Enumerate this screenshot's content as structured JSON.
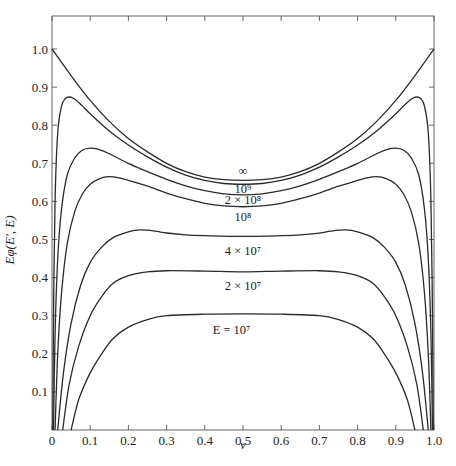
{
  "chart_data": {
    "type": "line",
    "title": "",
    "xlabel": "v",
    "ylabel": "Eφ(E′, E)",
    "xlim": [
      0,
      1.0
    ],
    "ylim": [
      0,
      1.1
    ],
    "grid": false,
    "x_ticks": [
      "0",
      "0.1",
      "0.2",
      "0.3",
      "0.4",
      "0.5",
      "0.6",
      "0.7",
      "0.8",
      "0.9",
      "1.0"
    ],
    "x_tick_values": [
      0,
      0.1,
      0.2,
      0.3,
      0.4,
      0.5,
      0.6,
      0.7,
      0.8,
      0.9,
      1.0
    ],
    "y_ticks": [
      "0.1",
      "0.2",
      "0.3",
      "0.4",
      "0.5",
      "0.6",
      "0.7",
      "0.8",
      "0.9",
      "1.0"
    ],
    "y_tick_values": [
      0.1,
      0.2,
      0.3,
      0.4,
      0.5,
      0.6,
      0.7,
      0.8,
      0.9,
      1.0
    ],
    "series": [
      {
        "name": "∞",
        "label": "∞",
        "label_at": [
          0.5,
          0.668
        ],
        "points": [
          [
            0,
            1.0
          ],
          [
            0.05,
            0.93
          ],
          [
            0.1,
            0.865
          ],
          [
            0.15,
            0.81
          ],
          [
            0.2,
            0.765
          ],
          [
            0.25,
            0.73
          ],
          [
            0.3,
            0.7
          ],
          [
            0.35,
            0.678
          ],
          [
            0.4,
            0.664
          ],
          [
            0.45,
            0.657
          ],
          [
            0.5,
            0.655
          ],
          [
            0.55,
            0.657
          ],
          [
            0.6,
            0.664
          ],
          [
            0.65,
            0.678
          ],
          [
            0.7,
            0.7
          ],
          [
            0.75,
            0.73
          ],
          [
            0.8,
            0.765
          ],
          [
            0.85,
            0.81
          ],
          [
            0.9,
            0.865
          ],
          [
            0.95,
            0.93
          ],
          [
            1.0,
            1.0
          ]
        ]
      },
      {
        "name": "10^9",
        "label": "10⁹",
        "label_at": [
          0.5,
          0.623
        ],
        "points": [
          [
            0.002,
            0.0
          ],
          [
            0.004,
            0.3
          ],
          [
            0.008,
            0.6
          ],
          [
            0.015,
            0.78
          ],
          [
            0.025,
            0.85
          ],
          [
            0.035,
            0.87
          ],
          [
            0.047,
            0.874
          ],
          [
            0.06,
            0.868
          ],
          [
            0.08,
            0.85
          ],
          [
            0.1,
            0.83
          ],
          [
            0.15,
            0.785
          ],
          [
            0.2,
            0.748
          ],
          [
            0.25,
            0.717
          ],
          [
            0.3,
            0.69
          ],
          [
            0.35,
            0.669
          ],
          [
            0.4,
            0.655
          ],
          [
            0.45,
            0.647
          ],
          [
            0.5,
            0.645
          ],
          [
            0.55,
            0.647
          ],
          [
            0.6,
            0.655
          ],
          [
            0.65,
            0.669
          ],
          [
            0.7,
            0.69
          ],
          [
            0.75,
            0.717
          ],
          [
            0.8,
            0.748
          ],
          [
            0.85,
            0.785
          ],
          [
            0.9,
            0.83
          ],
          [
            0.92,
            0.85
          ],
          [
            0.94,
            0.868
          ],
          [
            0.953,
            0.874
          ],
          [
            0.965,
            0.87
          ],
          [
            0.975,
            0.85
          ],
          [
            0.985,
            0.78
          ],
          [
            0.992,
            0.6
          ],
          [
            0.996,
            0.3
          ],
          [
            0.998,
            0.0
          ]
        ]
      },
      {
        "name": "2x10^8",
        "label": "2 × 10⁸",
        "label_at": [
          0.5,
          0.594
        ],
        "points": [
          [
            0.004,
            0.0
          ],
          [
            0.008,
            0.25
          ],
          [
            0.015,
            0.45
          ],
          [
            0.025,
            0.58
          ],
          [
            0.04,
            0.67
          ],
          [
            0.06,
            0.715
          ],
          [
            0.08,
            0.735
          ],
          [
            0.1,
            0.74
          ],
          [
            0.12,
            0.737
          ],
          [
            0.15,
            0.725
          ],
          [
            0.2,
            0.7
          ],
          [
            0.25,
            0.678
          ],
          [
            0.3,
            0.658
          ],
          [
            0.35,
            0.641
          ],
          [
            0.4,
            0.628
          ],
          [
            0.45,
            0.62
          ],
          [
            0.5,
            0.617
          ],
          [
            0.55,
            0.62
          ],
          [
            0.6,
            0.628
          ],
          [
            0.65,
            0.641
          ],
          [
            0.7,
            0.658
          ],
          [
            0.75,
            0.678
          ],
          [
            0.8,
            0.7
          ],
          [
            0.85,
            0.725
          ],
          [
            0.88,
            0.737
          ],
          [
            0.9,
            0.74
          ],
          [
            0.92,
            0.735
          ],
          [
            0.94,
            0.715
          ],
          [
            0.96,
            0.67
          ],
          [
            0.975,
            0.58
          ],
          [
            0.985,
            0.45
          ],
          [
            0.992,
            0.25
          ],
          [
            0.996,
            0.0
          ]
        ]
      },
      {
        "name": "10^8",
        "label": "10⁸",
        "label_at": [
          0.5,
          0.548
        ],
        "points": [
          [
            0.008,
            0.0
          ],
          [
            0.015,
            0.2
          ],
          [
            0.025,
            0.36
          ],
          [
            0.04,
            0.49
          ],
          [
            0.06,
            0.575
          ],
          [
            0.08,
            0.62
          ],
          [
            0.1,
            0.645
          ],
          [
            0.125,
            0.66
          ],
          [
            0.15,
            0.665
          ],
          [
            0.175,
            0.662
          ],
          [
            0.2,
            0.655
          ],
          [
            0.25,
            0.64
          ],
          [
            0.3,
            0.622
          ],
          [
            0.35,
            0.607
          ],
          [
            0.4,
            0.595
          ],
          [
            0.45,
            0.588
          ],
          [
            0.5,
            0.586
          ],
          [
            0.55,
            0.588
          ],
          [
            0.6,
            0.595
          ],
          [
            0.65,
            0.607
          ],
          [
            0.7,
            0.622
          ],
          [
            0.75,
            0.64
          ],
          [
            0.8,
            0.655
          ],
          [
            0.825,
            0.662
          ],
          [
            0.85,
            0.665
          ],
          [
            0.875,
            0.66
          ],
          [
            0.9,
            0.645
          ],
          [
            0.92,
            0.62
          ],
          [
            0.94,
            0.575
          ],
          [
            0.96,
            0.49
          ],
          [
            0.975,
            0.36
          ],
          [
            0.985,
            0.2
          ],
          [
            0.992,
            0.0
          ]
        ]
      },
      {
        "name": "4x10^7",
        "label": "4 × 10⁷",
        "label_at": [
          0.5,
          0.46
        ],
        "points": [
          [
            0.015,
            0.0
          ],
          [
            0.03,
            0.15
          ],
          [
            0.05,
            0.28
          ],
          [
            0.075,
            0.38
          ],
          [
            0.1,
            0.44
          ],
          [
            0.13,
            0.48
          ],
          [
            0.16,
            0.505
          ],
          [
            0.2,
            0.52
          ],
          [
            0.23,
            0.525
          ],
          [
            0.27,
            0.522
          ],
          [
            0.3,
            0.517
          ],
          [
            0.35,
            0.512
          ],
          [
            0.4,
            0.51
          ],
          [
            0.5,
            0.508
          ],
          [
            0.6,
            0.51
          ],
          [
            0.65,
            0.512
          ],
          [
            0.7,
            0.517
          ],
          [
            0.73,
            0.522
          ],
          [
            0.77,
            0.525
          ],
          [
            0.8,
            0.52
          ],
          [
            0.84,
            0.505
          ],
          [
            0.87,
            0.48
          ],
          [
            0.9,
            0.44
          ],
          [
            0.925,
            0.38
          ],
          [
            0.95,
            0.28
          ],
          [
            0.97,
            0.15
          ],
          [
            0.985,
            0.0
          ]
        ]
      },
      {
        "name": "2x10^7",
        "label": "2 × 10⁷",
        "label_at": [
          0.5,
          0.368
        ],
        "points": [
          [
            0.028,
            0.0
          ],
          [
            0.045,
            0.12
          ],
          [
            0.07,
            0.22
          ],
          [
            0.1,
            0.3
          ],
          [
            0.13,
            0.35
          ],
          [
            0.16,
            0.385
          ],
          [
            0.2,
            0.405
          ],
          [
            0.25,
            0.415
          ],
          [
            0.3,
            0.418
          ],
          [
            0.4,
            0.417
          ],
          [
            0.5,
            0.415
          ],
          [
            0.6,
            0.417
          ],
          [
            0.7,
            0.418
          ],
          [
            0.75,
            0.415
          ],
          [
            0.8,
            0.405
          ],
          [
            0.84,
            0.385
          ],
          [
            0.87,
            0.35
          ],
          [
            0.9,
            0.3
          ],
          [
            0.93,
            0.22
          ],
          [
            0.955,
            0.12
          ],
          [
            0.972,
            0.0
          ]
        ]
      },
      {
        "name": "10^7",
        "label": "E = 10⁷",
        "label_at": [
          0.47,
          0.253
        ],
        "points": [
          [
            0.05,
            0.0
          ],
          [
            0.07,
            0.08
          ],
          [
            0.1,
            0.15
          ],
          [
            0.13,
            0.2
          ],
          [
            0.16,
            0.24
          ],
          [
            0.2,
            0.27
          ],
          [
            0.25,
            0.29
          ],
          [
            0.3,
            0.3
          ],
          [
            0.4,
            0.304
          ],
          [
            0.5,
            0.305
          ],
          [
            0.6,
            0.304
          ],
          [
            0.7,
            0.3
          ],
          [
            0.75,
            0.29
          ],
          [
            0.8,
            0.27
          ],
          [
            0.84,
            0.24
          ],
          [
            0.87,
            0.2
          ],
          [
            0.9,
            0.15
          ],
          [
            0.93,
            0.08
          ],
          [
            0.95,
            0.0
          ]
        ]
      }
    ],
    "caption": "Figure 5.21 Division of energy between pair members (partially visible)"
  }
}
